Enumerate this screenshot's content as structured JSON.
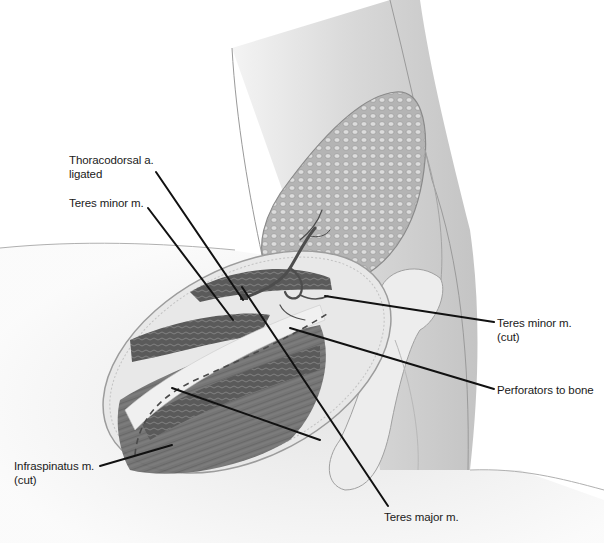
{
  "figure": {
    "colors": {
      "background": "#ffffff",
      "skin": "#e4e4e4",
      "skin_shadow": "#bdbdbd",
      "muscle": "#6e6e6e",
      "muscle_dark": "#4a4a4a",
      "fat_pad": "#a9a9a9",
      "bone": "#ededed",
      "leader_line": "#111111",
      "label_text": "#1a1a1a"
    }
  },
  "labels": [
    {
      "id": "thoracodorsal",
      "line1": "Thoracodorsal a.",
      "line2": "ligated",
      "x": 69,
      "y": 153,
      "leader": [
        [
          156,
          172
        ],
        [
          243,
          300
        ]
      ]
    },
    {
      "id": "teres-minor",
      "line1": "Teres minor m.",
      "line2": "",
      "x": 69,
      "y": 196,
      "leader": [
        [
          148,
          208
        ],
        [
          233,
          320
        ]
      ]
    },
    {
      "id": "teres-minor-cut",
      "line1": "Teres minor m.",
      "line2": "(cut)",
      "x": 497,
      "y": 316,
      "leader": [
        [
          494,
          322
        ],
        [
          325,
          296
        ]
      ]
    },
    {
      "id": "perforators",
      "line1": "Perforators to bone",
      "line2": "",
      "x": 497,
      "y": 385,
      "leader": [
        [
          494,
          389
        ],
        [
          290,
          328
        ]
      ]
    },
    {
      "id": "infraspinatus",
      "line1": "Infraspinatus m.",
      "line2": "(cut)",
      "x": 14,
      "y": 459,
      "leader": [
        [
          100,
          466
        ],
        [
          172,
          445
        ]
      ]
    },
    {
      "id": "teres-major",
      "line1": "Teres major m.",
      "line2": "",
      "x": 384,
      "y": 510,
      "leader": [
        [
          388,
          506
        ],
        [
          242,
          287
        ]
      ]
    }
  ],
  "extra_leaders": [
    {
      "id": "teres-major-branch",
      "points": [
        [
          320,
          440
        ],
        [
          172,
          388
        ]
      ]
    }
  ]
}
